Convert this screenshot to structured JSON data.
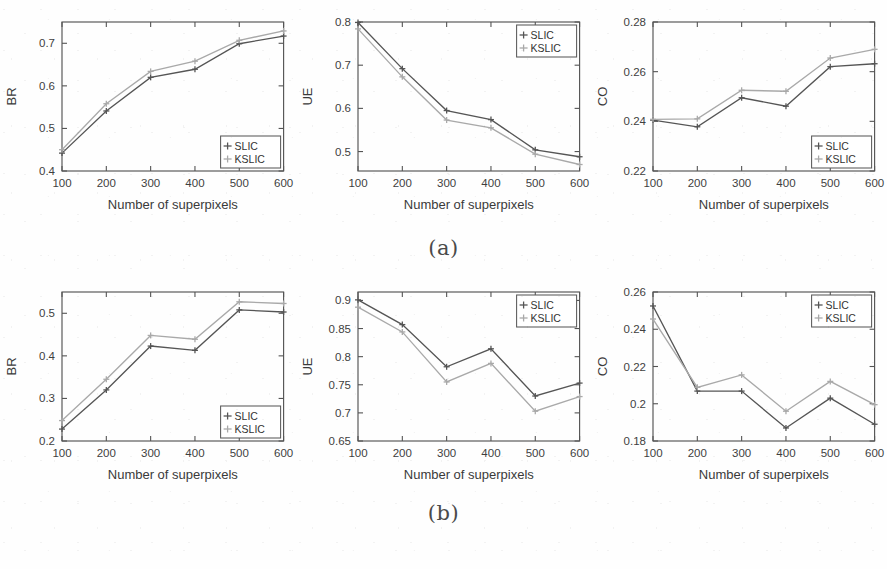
{
  "figure": {
    "captions": [
      {
        "id": "caption-a",
        "text": "(a)"
      },
      {
        "id": "caption-b",
        "text": "(b)"
      }
    ],
    "legend_entries": [
      "SLIC",
      "KSLIC"
    ],
    "colors": {
      "slic": "#555555",
      "kslic": "#a9a9a9",
      "axis": "#545454",
      "background": "#fefefe"
    }
  },
  "chart_data": [
    {
      "panel": "a",
      "position": "left",
      "type": "line",
      "title": "",
      "xlabel": "Number of superpixels",
      "ylabel": "BR",
      "x": [
        100,
        200,
        300,
        400,
        500,
        600
      ],
      "xticklabels": [
        "100",
        "200",
        "300",
        "400",
        "500",
        "600"
      ],
      "xlim": [
        100,
        600
      ],
      "ylim": [
        0.4,
        0.75
      ],
      "yticks": [
        0.4,
        0.5,
        0.6,
        0.7
      ],
      "yticklabels": [
        "0.4",
        "0.5",
        "0.6",
        "0.7"
      ],
      "grid": false,
      "legend_position": "bottom-right",
      "series": [
        {
          "name": "SLIC",
          "values": [
            0.442,
            0.541,
            0.62,
            0.639,
            0.699,
            0.717
          ]
        },
        {
          "name": "KSLIC",
          "values": [
            0.45,
            0.558,
            0.634,
            0.658,
            0.707,
            0.729
          ]
        }
      ]
    },
    {
      "panel": "a",
      "position": "center",
      "type": "line",
      "title": "",
      "xlabel": "Number of superpixels",
      "ylabel": "UE",
      "x": [
        100,
        200,
        300,
        400,
        500,
        600
      ],
      "xticklabels": [
        "100",
        "200",
        "300",
        "400",
        "500",
        "600"
      ],
      "xlim": [
        100,
        600
      ],
      "ylim": [
        0.455,
        0.8
      ],
      "yticks": [
        0.5,
        0.6,
        0.7,
        0.8
      ],
      "yticklabels": [
        "0.5",
        "0.6",
        "0.7",
        "0.8"
      ],
      "grid": false,
      "legend_position": "top-right",
      "series": [
        {
          "name": "SLIC",
          "values": [
            0.799,
            0.692,
            0.595,
            0.574,
            0.504,
            0.488
          ]
        },
        {
          "name": "KSLIC",
          "values": [
            0.784,
            0.673,
            0.573,
            0.555,
            0.494,
            0.47
          ]
        }
      ]
    },
    {
      "panel": "a",
      "position": "right",
      "type": "line",
      "title": "",
      "xlabel": "Number of superpixels",
      "ylabel": "CO",
      "x": [
        100,
        200,
        300,
        400,
        500,
        600
      ],
      "xticklabels": [
        "100",
        "200",
        "300",
        "400",
        "500",
        "600"
      ],
      "xlim": [
        100,
        600
      ],
      "ylim": [
        0.22,
        0.28
      ],
      "yticks": [
        0.22,
        0.24,
        0.26,
        0.28
      ],
      "yticklabels": [
        "0.22",
        "0.24",
        "0.26",
        "0.28"
      ],
      "grid": false,
      "legend_position": "bottom-right",
      "series": [
        {
          "name": "SLIC",
          "values": [
            0.2405,
            0.2378,
            0.2495,
            0.2461,
            0.262,
            0.2632
          ]
        },
        {
          "name": "KSLIC",
          "values": [
            0.2408,
            0.241,
            0.2525,
            0.2521,
            0.2655,
            0.269
          ]
        }
      ]
    },
    {
      "panel": "b",
      "position": "left",
      "type": "line",
      "title": "",
      "xlabel": "Number of superpixels",
      "ylabel": "BR",
      "x": [
        100,
        200,
        300,
        400,
        500,
        600
      ],
      "xticklabels": [
        "100",
        "200",
        "300",
        "400",
        "500",
        "600"
      ],
      "xlim": [
        100,
        600
      ],
      "ylim": [
        0.2,
        0.55
      ],
      "yticks": [
        0.2,
        0.3,
        0.4,
        0.5
      ],
      "yticklabels": [
        "0.2",
        "0.3",
        "0.4",
        "0.5"
      ],
      "grid": false,
      "legend_position": "bottom-right",
      "series": [
        {
          "name": "SLIC",
          "values": [
            0.228,
            0.32,
            0.423,
            0.413,
            0.508,
            0.503
          ]
        },
        {
          "name": "KSLIC",
          "values": [
            0.248,
            0.345,
            0.448,
            0.439,
            0.527,
            0.523
          ]
        }
      ]
    },
    {
      "panel": "b",
      "position": "center",
      "type": "line",
      "title": "",
      "xlabel": "Number of superpixels",
      "ylabel": "UE",
      "x": [
        100,
        200,
        300,
        400,
        500,
        600
      ],
      "xticklabels": [
        "100",
        "200",
        "300",
        "400",
        "500",
        "600"
      ],
      "xlim": [
        100,
        600
      ],
      "ylim": [
        0.65,
        0.915
      ],
      "yticks": [
        0.65,
        0.7,
        0.75,
        0.8,
        0.85,
        0.9
      ],
      "yticklabels": [
        "0.65",
        "0.7",
        "0.75",
        "0.8",
        "0.85",
        "0.9"
      ],
      "grid": false,
      "legend_position": "top-right",
      "series": [
        {
          "name": "SLIC",
          "values": [
            0.901,
            0.857,
            0.782,
            0.814,
            0.73,
            0.753
          ]
        },
        {
          "name": "KSLIC",
          "values": [
            0.888,
            0.844,
            0.755,
            0.788,
            0.703,
            0.729
          ]
        }
      ]
    },
    {
      "panel": "b",
      "position": "right",
      "type": "line",
      "title": "",
      "xlabel": "Number of superpixels",
      "ylabel": "CO",
      "x": [
        100,
        200,
        300,
        400,
        500,
        600
      ],
      "xticklabels": [
        "100",
        "200",
        "300",
        "400",
        "500",
        "600"
      ],
      "xlim": [
        100,
        600
      ],
      "ylim": [
        0.18,
        0.26
      ],
      "yticks": [
        0.18,
        0.2,
        0.22,
        0.24,
        0.26
      ],
      "yticklabels": [
        "0.18",
        "0.2",
        "0.22",
        "0.24",
        "0.26"
      ],
      "grid": false,
      "legend_position": "top-right",
      "series": [
        {
          "name": "SLIC",
          "values": [
            0.2525,
            0.2068,
            0.2068,
            0.187,
            0.203,
            0.189
          ]
        },
        {
          "name": "KSLIC",
          "values": [
            0.2455,
            0.2088,
            0.2155,
            0.196,
            0.212,
            0.1995
          ]
        }
      ]
    }
  ]
}
